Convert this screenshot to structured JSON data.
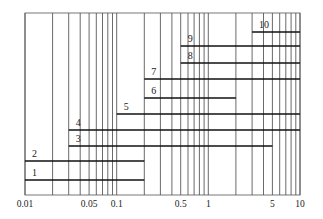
{
  "chart_data": {
    "type": "range-bar",
    "title": "",
    "xlabel": "",
    "ylabel": "",
    "x_scale": "log",
    "xlim": [
      0.01,
      10
    ],
    "grid": true,
    "x_tick_labels": [
      {
        "value": 0.01,
        "label": "0.01"
      },
      {
        "value": 0.05,
        "label": "0.05"
      },
      {
        "value": 0.1,
        "label": "0.1"
      },
      {
        "value": 0.5,
        "label": "0.5"
      },
      {
        "value": 1,
        "label": "1"
      },
      {
        "value": 5,
        "label": "5"
      },
      {
        "value": 10,
        "label": "10"
      }
    ],
    "gridlines": [
      0.01,
      0.02,
      0.03,
      0.04,
      0.05,
      0.06,
      0.07,
      0.08,
      0.09,
      0.1,
      0.2,
      0.3,
      0.4,
      0.5,
      0.6,
      0.7,
      0.8,
      0.9,
      1,
      2,
      3,
      4,
      5,
      6,
      7,
      8,
      9,
      10
    ],
    "series": [
      {
        "name": "1",
        "start": 0.01,
        "end": 0.2,
        "y": 180
      },
      {
        "name": "2",
        "start": 0.01,
        "end": 0.2,
        "y": 161
      },
      {
        "name": "3",
        "start": 0.03,
        "end": 5,
        "y": 146
      },
      {
        "name": "4",
        "start": 0.03,
        "end": 10,
        "y": 130
      },
      {
        "name": "5",
        "start": 0.1,
        "end": 10,
        "y": 114
      },
      {
        "name": "6",
        "start": 0.2,
        "end": 2,
        "y": 98
      },
      {
        "name": "7",
        "start": 0.2,
        "end": 10,
        "y": 79
      },
      {
        "name": "8",
        "start": 0.5,
        "end": 10,
        "y": 63
      },
      {
        "name": "9",
        "start": 0.5,
        "end": 10,
        "y": 46
      },
      {
        "name": "10",
        "start": 3,
        "end": 10,
        "y": 32
      }
    ]
  }
}
